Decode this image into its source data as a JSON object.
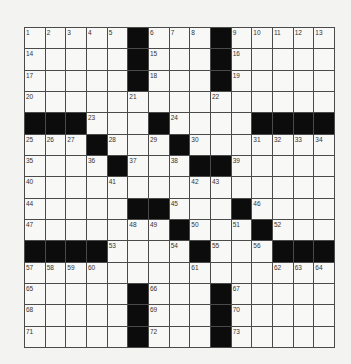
{
  "puzzle": {
    "size": {
      "rows": 15,
      "cols": 15
    },
    "legend": {
      "black": "#",
      "blank": ""
    },
    "colors": {
      "background": "#f3f3f1",
      "cell": "#f8f8f6",
      "block": "#0c0c0c",
      "gridline": "#4a4a4a",
      "number": "#333333"
    },
    "grid": [
      [
        "1",
        "2",
        "3",
        "4",
        "5",
        "#",
        "6",
        "7",
        "8",
        "#",
        "9",
        "10",
        "11",
        "12",
        "13"
      ],
      [
        "14",
        "",
        "",
        "",
        "",
        "#",
        "15",
        "",
        "",
        "#",
        "16",
        "",
        "",
        "",
        ""
      ],
      [
        "17",
        "",
        "",
        "",
        "",
        "#",
        "18",
        "",
        "",
        "#",
        "19",
        "",
        "",
        "",
        ""
      ],
      [
        "20",
        "",
        "",
        "",
        "",
        "21",
        "",
        "",
        "",
        "22",
        "",
        "",
        "",
        "",
        ""
      ],
      [
        "#",
        "#",
        "#",
        "23",
        "",
        "",
        "#",
        "24",
        "",
        "",
        "",
        "#",
        "#",
        "#",
        "#"
      ],
      [
        "25",
        "26",
        "27",
        "#",
        "28",
        "",
        "29",
        "#",
        "30",
        "",
        "",
        "31",
        "32",
        "33",
        "34"
      ],
      [
        "35",
        "",
        "",
        "36",
        "#",
        "37",
        "",
        "38",
        "#",
        "#",
        "39",
        "",
        "",
        "",
        ""
      ],
      [
        "40",
        "",
        "",
        "",
        "41",
        "",
        "",
        "",
        "42",
        "43",
        "",
        "",
        "",
        "",
        ""
      ],
      [
        "44",
        "",
        "",
        "",
        "",
        "#",
        "#",
        "45",
        "",
        "",
        "#",
        "46",
        "",
        "",
        ""
      ],
      [
        "47",
        "",
        "",
        "",
        "",
        "48",
        "49",
        "#",
        "50",
        "",
        "51",
        "#",
        "52",
        "",
        ""
      ],
      [
        "#",
        "#",
        "#",
        "#",
        "53",
        "",
        "",
        "54",
        "#",
        "55",
        "",
        "56",
        "#",
        "#",
        "#"
      ],
      [
        "57",
        "58",
        "59",
        "60",
        "",
        "",
        "",
        "",
        "61",
        "",
        "",
        "",
        "62",
        "63",
        "64"
      ],
      [
        "65",
        "",
        "",
        "",
        "",
        "#",
        "66",
        "",
        "",
        "#",
        "67",
        "",
        "",
        "",
        ""
      ],
      [
        "68",
        "",
        "",
        "",
        "",
        "#",
        "69",
        "",
        "",
        "#",
        "70",
        "",
        "",
        "",
        ""
      ],
      [
        "71",
        "",
        "",
        "",
        "",
        "#",
        "72",
        "",
        "",
        "#",
        "73",
        "",
        "",
        "",
        ""
      ]
    ]
  }
}
